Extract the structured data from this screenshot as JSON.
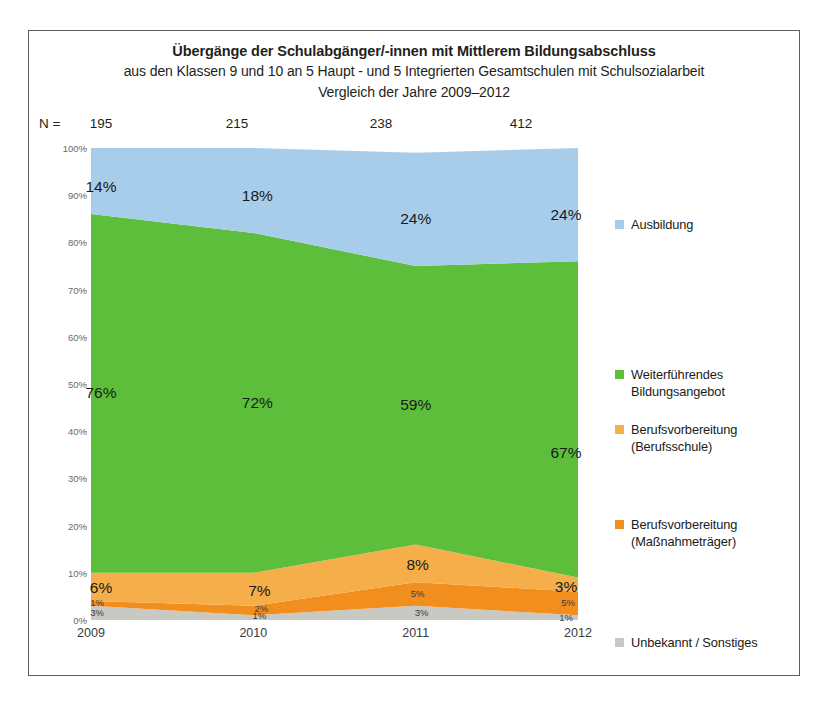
{
  "chart_data": {
    "type": "area",
    "title": "Übergänge der Schulabgänger/-innen mit Mittlerem Bildungsabschluss",
    "subtitle": "aus den Klassen 9 und 10 an 5 Haupt - und 5 Integrierten Gesamtschulen mit Schulsozialarbeit",
    "subtitle2": "Vergleich der Jahre 2009–2012",
    "xlabel": "",
    "ylabel": "",
    "ylim": [
      0,
      100
    ],
    "grid": false,
    "legend_position": "right",
    "categories": [
      "2009",
      "2010",
      "2011",
      "2012"
    ],
    "n_label": "N =",
    "n_values": [
      "195",
      "215",
      "238",
      "412"
    ],
    "ytick_labels": [
      "0%",
      "10%",
      "20%",
      "30%",
      "40%",
      "50%",
      "60%",
      "70%",
      "80%",
      "90%",
      "100%"
    ],
    "series": [
      {
        "name": "Unbekannt / Sonstiges",
        "color": "#c9c9c4",
        "values": [
          3,
          1,
          3,
          1
        ],
        "labels": [
          "3%",
          "1%",
          "3%",
          "1%"
        ]
      },
      {
        "name": "Berufsvorbereitung (Maßnahmeträger)",
        "color": "#f28e1e",
        "values": [
          1,
          2,
          5,
          5
        ],
        "labels": [
          "1%",
          "2%",
          "5%",
          "5%"
        ]
      },
      {
        "name": "Berufsvorbereitung (Berufsschule)",
        "color": "#f5ae4a",
        "values": [
          6,
          7,
          8,
          3
        ],
        "labels": [
          "6%",
          "7%",
          "8%",
          "3%"
        ]
      },
      {
        "name": "Weiterführendes Bildungsangebot",
        "color": "#5cbe3a",
        "values": [
          76,
          72,
          59,
          67
        ],
        "labels": [
          "76%",
          "72%",
          "59%",
          "67%"
        ]
      },
      {
        "name": "Ausbildung",
        "color": "#a8cdea",
        "values": [
          14,
          18,
          24,
          24
        ],
        "labels": [
          "14%",
          "18%",
          "24%",
          "24%"
        ]
      }
    ],
    "legend": [
      {
        "label": "Ausbildung",
        "color": "#a8cdea"
      },
      {
        "label": "Weiterführendes Bildungsangebot",
        "color": "#5cbe3a"
      },
      {
        "label": "Berufsvorbereitung (Berufsschule)",
        "color": "#f5ae4a"
      },
      {
        "label": "Berufsvorbereitung (Maßnahmeträger)",
        "color": "#f28e1e"
      },
      {
        "label": "Unbekannt / Sonstiges",
        "color": "#c9c9c4"
      }
    ]
  }
}
